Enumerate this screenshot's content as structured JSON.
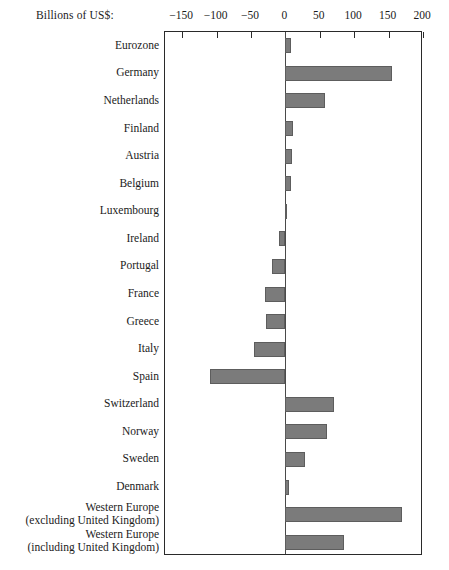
{
  "chart_data": {
    "type": "bar",
    "orientation": "horizontal",
    "title": "",
    "xlabel": "Billions of US$:",
    "ylabel": "",
    "xlim": [
      -175,
      200
    ],
    "xticks": [
      -150,
      -100,
      -50,
      0,
      50,
      100,
      150,
      200
    ],
    "xtick_labels": [
      "−150",
      "−100",
      "−50",
      "0",
      "50",
      "100",
      "150",
      "200"
    ],
    "grid": false,
    "legend": "none",
    "zero_line": 0,
    "bar_color": "#7b7b7b",
    "bar_edge_color": "#5d5d5d",
    "categories": [
      "Eurozone",
      "Germany",
      "Netherlands",
      "Finland",
      "Austria",
      "Belgium",
      "Luxembourg",
      "Ireland",
      "Portugal",
      "France",
      "Greece",
      "Italy",
      "Spain",
      "Switzerland",
      "Norway",
      "Sweden",
      "Denmark",
      "Western Europe\n(excluding United Kingdom)",
      "Western Europe\n(including United Kingdom)"
    ],
    "category_lines": [
      [
        "Eurozone",
        ""
      ],
      [
        "Germany",
        ""
      ],
      [
        "Netherlands",
        ""
      ],
      [
        "Finland",
        ""
      ],
      [
        "Austria",
        ""
      ],
      [
        "Belgium",
        ""
      ],
      [
        "Luxembourg",
        ""
      ],
      [
        "Ireland",
        ""
      ],
      [
        "Portugal",
        ""
      ],
      [
        "France",
        ""
      ],
      [
        "Greece",
        ""
      ],
      [
        "Italy",
        ""
      ],
      [
        "Spain",
        ""
      ],
      [
        "Switzerland",
        ""
      ],
      [
        "Norway",
        ""
      ],
      [
        "Sweden",
        ""
      ],
      [
        "Denmark",
        ""
      ],
      [
        "Western Europe",
        "(excluding United Kingdom)"
      ],
      [
        "Western Europe",
        "(including United Kingdom)"
      ]
    ],
    "values": [
      8,
      155,
      57,
      11,
      10,
      8,
      2,
      -10,
      -20,
      -30,
      -28,
      -45,
      -110,
      70,
      60,
      28,
      5,
      170,
      85
    ]
  }
}
